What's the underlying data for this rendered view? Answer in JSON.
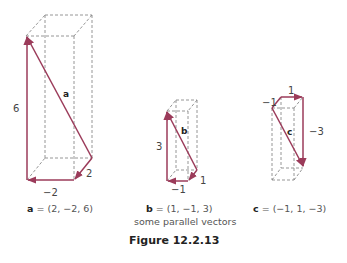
{
  "figure": {
    "title": "Figure 12.2.13",
    "subtitle": "some parallel vectors",
    "vector_color": "#9b3b5a",
    "box_line_color": "#8a8a8a"
  },
  "vectors": [
    {
      "name": "a",
      "components": [
        2,
        -2,
        6
      ],
      "caption_name": "a",
      "caption_value": " = (2, −2, 6)",
      "labels": {
        "x": "−2",
        "y": "2",
        "z": "6",
        "name": "a"
      }
    },
    {
      "name": "b",
      "components": [
        1,
        -1,
        3
      ],
      "caption_name": "b",
      "caption_value": " = (1, −1, 3)",
      "labels": {
        "x": "−1",
        "y": "1",
        "z": "3",
        "name": "b"
      }
    },
    {
      "name": "c",
      "components": [
        -1,
        1,
        -3
      ],
      "caption_name": "c",
      "caption_value": " = (−1, 1, −3)",
      "labels": {
        "x": "1",
        "y": "−1",
        "z": "−3",
        "name": "c"
      }
    }
  ]
}
